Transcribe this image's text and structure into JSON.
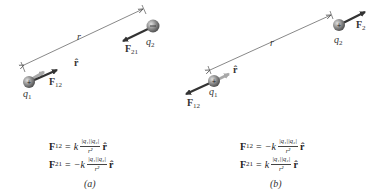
{
  "panels": [
    {
      "id": "a",
      "caption": "(a)",
      "charges": [
        {
          "label": "q",
          "sub": "1",
          "sign": "+"
        },
        {
          "label": "q",
          "sub": "2",
          "sign": "−"
        }
      ],
      "forces": [
        {
          "label": "F",
          "sub": "12"
        },
        {
          "label": "F",
          "sub": "21"
        }
      ],
      "distance_label": "r",
      "unit_vector_label": "r̂",
      "equations": [
        {
          "lhs": "F",
          "lhs_sub": "12",
          "eq": "=",
          "coef": "k",
          "num": "|q₁||q₂|",
          "den": "r²",
          "vec": "r̂"
        },
        {
          "lhs": "F",
          "lhs_sub": "21",
          "eq": "=",
          "coef": "−k",
          "num": "|q₁||q₂|",
          "den": "r²",
          "vec": "r̂"
        }
      ]
    },
    {
      "id": "b",
      "caption": "(b)",
      "charges": [
        {
          "label": "q",
          "sub": "1",
          "sign": "+"
        },
        {
          "label": "q",
          "sub": "2",
          "sign": "+"
        }
      ],
      "forces": [
        {
          "label": "F",
          "sub": "12"
        },
        {
          "label": "F",
          "sub": "2"
        }
      ],
      "distance_label": "r",
      "unit_vector_label": "r̂",
      "equations": [
        {
          "lhs": "F",
          "lhs_sub": "12",
          "eq": "=",
          "coef": "−k",
          "num": "|q₁||q₂|",
          "den": "r²",
          "vec": "r̂"
        },
        {
          "lhs": "F",
          "lhs_sub": "21",
          "eq": "=",
          "coef": "k",
          "num": "|q₁||q₂|",
          "den": "r²",
          "vec": "r̂"
        }
      ]
    }
  ],
  "colors": {
    "charge_fill": "#8a8a8a",
    "charge_highlight": "#cfcfcf",
    "force_arrow": "#333333",
    "unit_vector_arrow": "#a8a8a8",
    "dimension_line": "#555555"
  }
}
